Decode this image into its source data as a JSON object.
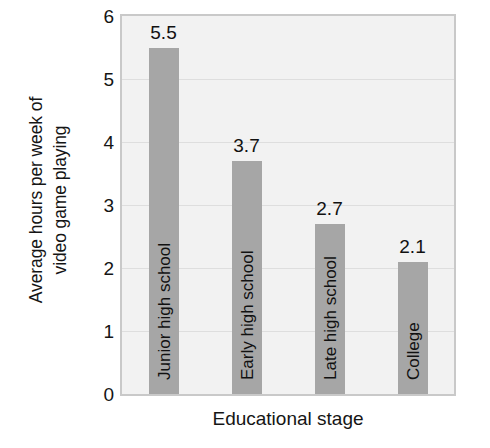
{
  "chart_data": {
    "type": "bar",
    "title": "",
    "subtitle": "",
    "xlabel": "Educational stage",
    "ylabel": "Average hours per week of video game playing",
    "ylabel_lines": [
      "Average hours per week of",
      "video game playing"
    ],
    "categories": [
      "Junior high school",
      "Early high school",
      "Late high school",
      "College"
    ],
    "values": [
      5.5,
      3.7,
      2.7,
      2.1
    ],
    "value_labels": [
      "5.5",
      "3.7",
      "2.7",
      "2.1"
    ],
    "ylim": [
      0,
      6
    ],
    "yticks": [
      6,
      5,
      4,
      3,
      2,
      1,
      0
    ],
    "ytick_labels": [
      "6",
      "5",
      "4",
      "3",
      "2",
      "1",
      "0"
    ],
    "grid": true,
    "grid_orientation": "horizontal",
    "legend": false,
    "legend_position": "none",
    "bar_color": "#a6a6a6",
    "plot_background": "#f2f2f2",
    "grid_color": "#dedede",
    "axis_border_color": "#c9c9c9",
    "text_color": "#151515",
    "bar_label_orientation": "vertical-inside",
    "value_label_position": "above-bar"
  }
}
